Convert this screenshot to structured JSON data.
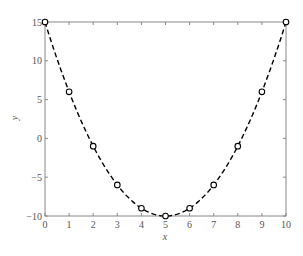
{
  "chart_data": {
    "type": "line",
    "title": "",
    "xlabel": "x",
    "ylabel": "y",
    "xlim": [
      0,
      10
    ],
    "ylim": [
      -10,
      15
    ],
    "grid": false,
    "legend": null,
    "x_ticks": [
      "0",
      "1",
      "2",
      "3",
      "4",
      "5",
      "6",
      "7",
      "8",
      "9",
      "10"
    ],
    "y_ticks": [
      "15",
      "10",
      "5",
      "0",
      "−5",
      "−10"
    ],
    "series": [
      {
        "name": "y = (x-5)^2 - 10",
        "style": "dashed line with circle markers",
        "color": "#000000",
        "x": [
          0,
          1,
          2,
          3,
          4,
          5,
          6,
          7,
          8,
          9,
          10
        ],
        "values": [
          15,
          6,
          -1,
          -6,
          -9,
          -10,
          -9,
          -6,
          -1,
          6,
          15
        ]
      }
    ]
  }
}
